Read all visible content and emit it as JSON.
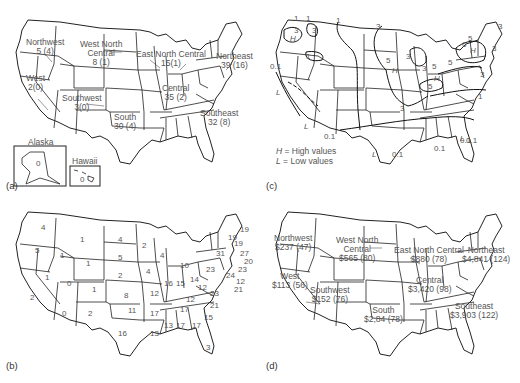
{
  "figure": {
    "panels": [
      {
        "tag": "(a)",
        "regions": [
          {
            "name": "Northwest",
            "value": "5 (4)"
          },
          {
            "name": "West North Central",
            "line1": "West North",
            "line2": "Central",
            "value": "8 (1)"
          },
          {
            "name": "East North Central",
            "value": "15(1)"
          },
          {
            "name": "Northeast",
            "value": "39 (16)"
          },
          {
            "name": "West",
            "value": "2(0)"
          },
          {
            "name": "Southwest",
            "value": "3(0)"
          },
          {
            "name": "Central",
            "value": "35 (2)"
          },
          {
            "name": "South",
            "value": "30 (4)"
          },
          {
            "name": "Southeast",
            "value": "32 (8)"
          }
        ],
        "insets": [
          {
            "name": "Alaska",
            "value": "0"
          },
          {
            "name": "Hawaii",
            "value": "0"
          }
        ]
      },
      {
        "tag": "(b)",
        "state_values": [
          {
            "state": "WA",
            "value": "4"
          },
          {
            "state": "OR",
            "value": "5"
          },
          {
            "state": "CA",
            "value": "2"
          },
          {
            "state": "NV",
            "value": "1"
          },
          {
            "state": "ID",
            "value": "1"
          },
          {
            "state": "MT",
            "value": "1"
          },
          {
            "state": "WY",
            "value": "1"
          },
          {
            "state": "UT",
            "value": "0"
          },
          {
            "state": "CO",
            "value": "1"
          },
          {
            "state": "AZ",
            "value": "0"
          },
          {
            "state": "NM",
            "value": "2"
          },
          {
            "state": "ND",
            "value": "4"
          },
          {
            "state": "SD",
            "value": "5"
          },
          {
            "state": "NE",
            "value": "2"
          },
          {
            "state": "KS",
            "value": "8"
          },
          {
            "state": "OK",
            "value": "11"
          },
          {
            "state": "TX",
            "value": "16"
          },
          {
            "state": "MN",
            "value": "2"
          },
          {
            "state": "IA",
            "value": "4"
          },
          {
            "state": "MO",
            "value": "12"
          },
          {
            "state": "AR",
            "value": "17"
          },
          {
            "state": "LA",
            "value": "13"
          },
          {
            "state": "WI",
            "value": "4"
          },
          {
            "state": "IL",
            "value": "16"
          },
          {
            "state": "MI",
            "value": "10"
          },
          {
            "state": "IN",
            "value": "15"
          },
          {
            "state": "OH",
            "value": "14"
          },
          {
            "state": "KY",
            "value": "12"
          },
          {
            "state": "TN",
            "value": "17"
          },
          {
            "state": "MS",
            "value": "13"
          },
          {
            "state": "AL",
            "value": "17"
          },
          {
            "state": "GA",
            "value": "17"
          },
          {
            "state": "FL",
            "value": "3"
          },
          {
            "state": "SC",
            "value": "15"
          },
          {
            "state": "NC",
            "value": "21"
          },
          {
            "state": "VA",
            "value": "23"
          },
          {
            "state": "WV",
            "value": "12"
          },
          {
            "state": "PA",
            "value": "23"
          },
          {
            "state": "NY",
            "value": "31"
          },
          {
            "state": "VT",
            "value": "19"
          },
          {
            "state": "NH",
            "value": "19"
          },
          {
            "state": "ME",
            "value": "19"
          },
          {
            "state": "MA",
            "value": "27"
          },
          {
            "state": "RI",
            "value": "20"
          },
          {
            "state": "CT",
            "value": "23"
          },
          {
            "state": "NJ",
            "value": "24"
          },
          {
            "state": "DE",
            "value": "12"
          },
          {
            "state": "MD",
            "value": "21"
          }
        ]
      },
      {
        "tag": "(c)",
        "isolines": [
          "1",
          "1",
          "1",
          "3",
          "3",
          "3",
          "H",
          "1",
          "0.1",
          "L",
          "L",
          "L",
          "3",
          "5",
          "H",
          "3",
          "3",
          "5",
          "H",
          "5",
          "5",
          "6",
          "5",
          "H",
          "3",
          "3",
          "3",
          "1",
          "0.1",
          "0.1",
          "L",
          "0.1",
          "0.1",
          "0.1",
          "L"
        ],
        "legend": [
          {
            "symbol": "H",
            "text": " = High values"
          },
          {
            "symbol": "L",
            "text": " = Low values"
          }
        ]
      },
      {
        "tag": "(d)",
        "regions": [
          {
            "name": "Northwest",
            "value": "$237 (47)"
          },
          {
            "name": "West North Central",
            "line1": "West North",
            "line2": "Central",
            "value": "$565 (80)"
          },
          {
            "name": "East North Central",
            "value": "$880 (78)"
          },
          {
            "name": "Northeast",
            "value": "$4,841 (124)"
          },
          {
            "name": "West",
            "value": "$113 (56)"
          },
          {
            "name": "Southwest",
            "value": "$152 (76)"
          },
          {
            "name": "Central",
            "value": "$3,420 (98)"
          },
          {
            "name": "South",
            "value": "$2,84 (78)"
          },
          {
            "name": "Southeast",
            "value": "$3,903 (122)"
          }
        ]
      }
    ]
  }
}
